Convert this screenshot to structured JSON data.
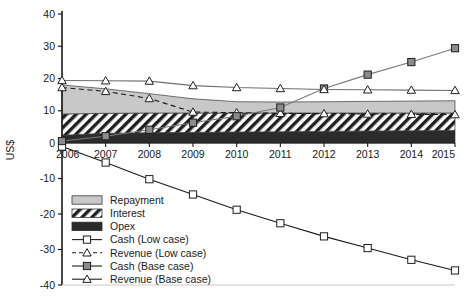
{
  "chart_data": {
    "type": "area",
    "title": "",
    "xlabel": "",
    "ylabel": "US$",
    "ylim": [
      -40,
      40
    ],
    "yticks": [
      40,
      30,
      20,
      10,
      0,
      -10,
      -20,
      -30,
      -40
    ],
    "ytick_labels": [
      "40",
      "30",
      "20",
      "10",
      "0",
      "-10",
      "-20",
      "-30",
      "-40"
    ],
    "categories": [
      2006,
      2007,
      2008,
      2009,
      2010,
      2011,
      2012,
      2013,
      2014,
      2015
    ],
    "xtick_labels": [
      "2006",
      "2007",
      "2008",
      "2009",
      "2010",
      "2011",
      "2012",
      "2013",
      "2014",
      "2015"
    ],
    "grid": false,
    "legend_position": "lower-left",
    "stacked_areas": [
      {
        "name": "Opex",
        "fill": "#2b2b2b",
        "pattern": "solid-dark",
        "values": [
          2.4,
          3.0,
          3.2,
          3.3,
          3.4,
          3.5,
          3.6,
          3.7,
          3.8,
          3.9
        ]
      },
      {
        "name": "Interest",
        "fill": "#ffffff",
        "pattern": "diagonal-hatch",
        "values": [
          6.6,
          6.2,
          6.1,
          6.0,
          5.9,
          5.8,
          5.7,
          5.6,
          5.5,
          5.4
        ]
      },
      {
        "name": "Repayment",
        "fill": "#c8c8c8",
        "pattern": "light-gray",
        "values": [
          9.0,
          7.6,
          6.0,
          4.4,
          3.5,
          3.4,
          3.5,
          3.6,
          3.7,
          3.8
        ]
      }
    ],
    "series": [
      {
        "name": "Cash (Low case)",
        "marker": "open-square",
        "line": "solid",
        "color": "#1a1a1a",
        "values": [
          -1.0,
          -5.5,
          -10.2,
          -14.5,
          -18.8,
          -22.6,
          -26.3,
          -29.6,
          -32.9,
          -35.9
        ]
      },
      {
        "name": "Revenue (Low case)",
        "marker": "open-triangle",
        "line": "dashed",
        "color": "#1a1a1a",
        "values": [
          17.2,
          16.0,
          13.8,
          9.6,
          9.4,
          9.2,
          9.1,
          9.0,
          8.9,
          8.8
        ]
      },
      {
        "name": "Cash (Base case)",
        "marker": "filled-square",
        "line": "solid",
        "color": "#7a7a7a",
        "values": [
          0.6,
          2.1,
          4.1,
          6.3,
          8.3,
          11.0,
          16.9,
          21.2,
          25.1,
          29.4
        ]
      },
      {
        "name": "Revenue (Base case)",
        "marker": "open-triangle",
        "line": "solid",
        "color": "#6e6e6e",
        "values": [
          19.4,
          19.3,
          19.2,
          17.8,
          17.2,
          16.9,
          16.6,
          16.5,
          16.4,
          16.3
        ]
      }
    ],
    "legend_entries": [
      {
        "label": "Repayment",
        "swatch": "light-gray-box"
      },
      {
        "label": "Interest",
        "swatch": "hatch-box"
      },
      {
        "label": "Opex",
        "swatch": "dark-box"
      },
      {
        "label": "Cash (Low case)",
        "swatch": "line-open-square"
      },
      {
        "label": "Revenue (Low case)",
        "swatch": "dashed-line-open-triangle"
      },
      {
        "label": "Cash (Base case)",
        "swatch": "line-filled-square"
      },
      {
        "label": "Revenue (Base case)",
        "swatch": "line-open-triangle"
      }
    ]
  }
}
